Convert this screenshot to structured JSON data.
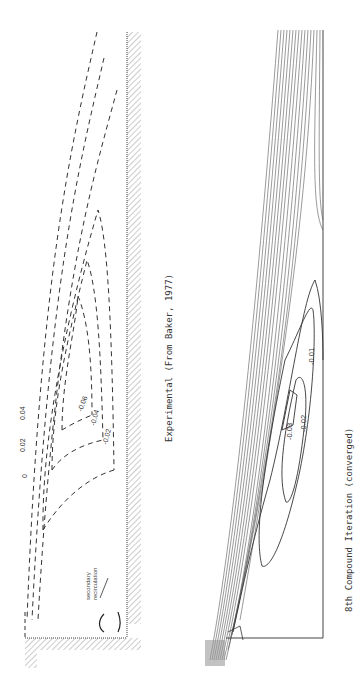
{
  "figure": {
    "panels": [
      {
        "id": "experimental",
        "caption": "Experimental (From Baker, 1977)",
        "line_style": "dashed",
        "contour_labels": [
          "0",
          "0.02",
          "0.04",
          "-0.06",
          "-0.04",
          "-0.02"
        ],
        "annotation": {
          "line1": "secondary",
          "line2": "recirculation"
        }
      },
      {
        "id": "computed",
        "caption": "8th Compound Iteration (converged)",
        "line_style": "solid",
        "contour_labels": [
          "-0.03",
          "-0.02",
          "-0.01"
        ]
      }
    ]
  }
}
